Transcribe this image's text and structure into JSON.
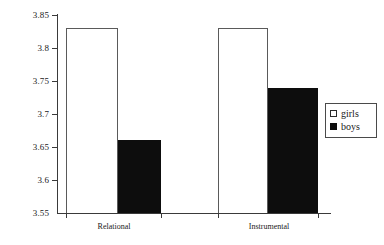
{
  "chart_data": {
    "type": "bar",
    "title": "",
    "subtitle": "",
    "xlabel": "",
    "ylabel": "",
    "categories": [
      "Relational",
      "Instrumental"
    ],
    "series": [
      {
        "name": "girls",
        "values": [
          3.83,
          3.83
        ],
        "color": "#ffffff",
        "swatch": "open-square"
      },
      {
        "name": "boys",
        "values": [
          3.66,
          3.74
        ],
        "color": "#0d0d0d",
        "swatch": "filled-square"
      }
    ],
    "ylim": [
      3.55,
      3.85
    ],
    "ytick_values": [
      3.85,
      3.8,
      3.75,
      3.7,
      3.65,
      3.6,
      3.55
    ],
    "ytick_labels": [
      "3.85",
      "3.8",
      "3.75",
      "3.7",
      "3.65",
      "3.6",
      "3.55"
    ],
    "grid": false,
    "legend_position": "right",
    "legend_entries": [
      "girls",
      "boys"
    ],
    "annotations": []
  },
  "axes": {
    "y_tick_0": "3.85",
    "y_tick_1": "3.8",
    "y_tick_2": "3.75",
    "y_tick_3": "3.7",
    "y_tick_4": "3.65",
    "y_tick_5": "3.6",
    "y_tick_6": "3.55"
  },
  "groups": {
    "group_0_label": "Relational",
    "group_1_label": "Instrumental"
  },
  "legend": {
    "girls_label": "girls",
    "boys_label": "boys"
  }
}
